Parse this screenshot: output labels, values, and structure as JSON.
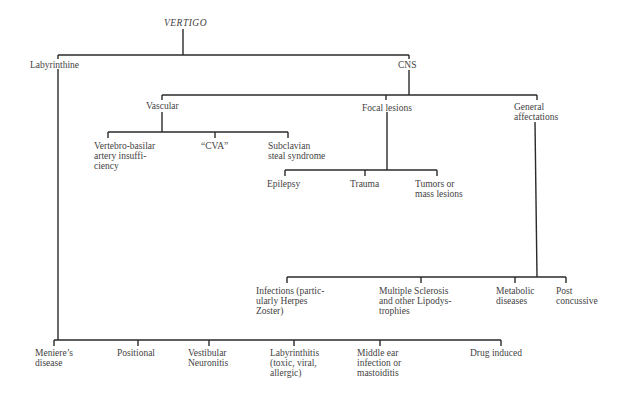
{
  "diagram": {
    "root": "VERTIGO",
    "level1": {
      "labyrinthine": "Labyrinthine",
      "cns": "CNS"
    },
    "cns_children": {
      "vascular": "Vascular",
      "focal": "Focal lesions",
      "general": "General\naffectations"
    },
    "vascular_children": [
      "Vertebro-basilar\nartery insuffi-\nciency",
      "“CVA”",
      "Subclavian\nsteal syndrome"
    ],
    "focal_children": [
      "Epilepsy",
      "Trauma",
      "Tumors or\nmass lesions"
    ],
    "general_children": [
      "Infections (partic-\nularly Herpes\nZoster)",
      "Multiple Sclerosis\nand other Lipodys-\ntrophies",
      "Metabolic\ndiseases",
      "Post\nconcussive"
    ],
    "labyrinthine_children": [
      "Meniere’s\ndisease",
      "Positional",
      "Vestibular\nNeuronitis",
      "Labyrinthitis\n(toxic, viral,\nallergic)",
      "Middle ear\ninfection or\nmastoiditis",
      "Drug induced"
    ]
  }
}
